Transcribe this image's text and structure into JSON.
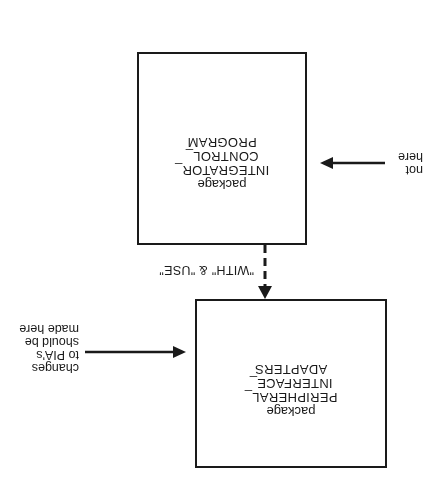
{
  "diagram": {
    "orientation": "rotated 180 degrees (upside down)",
    "boxes": [
      {
        "id": "integrator",
        "keyword": "package",
        "name_lines": [
          "INTEGRATOR_",
          "CONTROL_",
          "PROGRAM"
        ]
      },
      {
        "id": "pia",
        "keyword": "package",
        "name_lines": [
          "PERIPHERAL_",
          "INTERFACE_",
          "ADAPTERS"
        ]
      }
    ],
    "connectors": [
      {
        "from": "integrator",
        "to": "pia",
        "style": "dashed",
        "label": "\"WITH\" & \"USE\""
      }
    ],
    "annotations": [
      {
        "target": "pia",
        "lines": [
          "changes",
          "to PIA's",
          "should be",
          "made here"
        ]
      },
      {
        "target": "integrator",
        "lines": [
          "not",
          "here"
        ]
      }
    ],
    "colors": {
      "ink": "#1a1a1a",
      "background": "#ffffff"
    }
  }
}
